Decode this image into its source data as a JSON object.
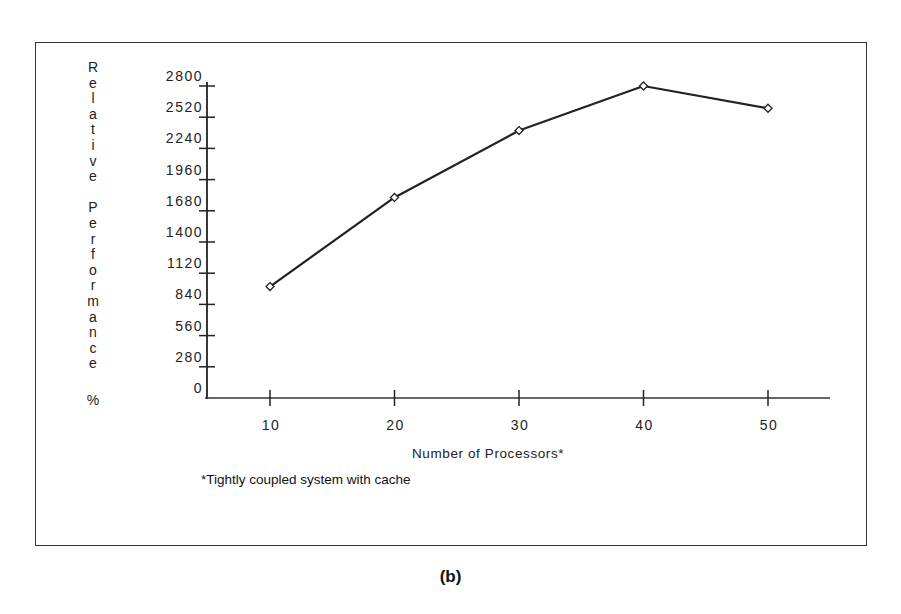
{
  "figure": {
    "caption": "(b)",
    "footnote": "*Tightly coupled system with cache"
  },
  "chart_data": {
    "type": "line",
    "title": "",
    "xlabel": "Number of Processors*",
    "ylabel": "Relative Performance %",
    "ylabel_letters": [
      "R",
      "e",
      "l",
      "a",
      "t",
      "i",
      "v",
      "e",
      "",
      "P",
      "e",
      "r",
      "f",
      "o",
      "r",
      "m",
      "a",
      "n",
      "c",
      "e"
    ],
    "ylabel_suffix": "%",
    "x": [
      10,
      20,
      30,
      40,
      50
    ],
    "x_tick_labels": [
      "10",
      "20",
      "30",
      "40",
      "50"
    ],
    "y_tick_values": [
      0,
      280,
      560,
      840,
      1120,
      1400,
      1680,
      1960,
      2240,
      2520,
      2800
    ],
    "y_tick_labels": [
      "0",
      "280",
      "560",
      "840",
      "1120",
      "1400",
      "1680",
      "1960",
      "2240",
      "2520",
      "2800"
    ],
    "series": [
      {
        "name": "Relative Performance",
        "marker": "diamond-open",
        "values": [
          1000,
          1800,
          2400,
          2800,
          2600
        ]
      }
    ],
    "xlim": [
      4.5,
      55
    ],
    "ylim": [
      0,
      2800
    ],
    "grid": false,
    "legend": "none",
    "footnote": "*Tightly coupled system with cache"
  }
}
